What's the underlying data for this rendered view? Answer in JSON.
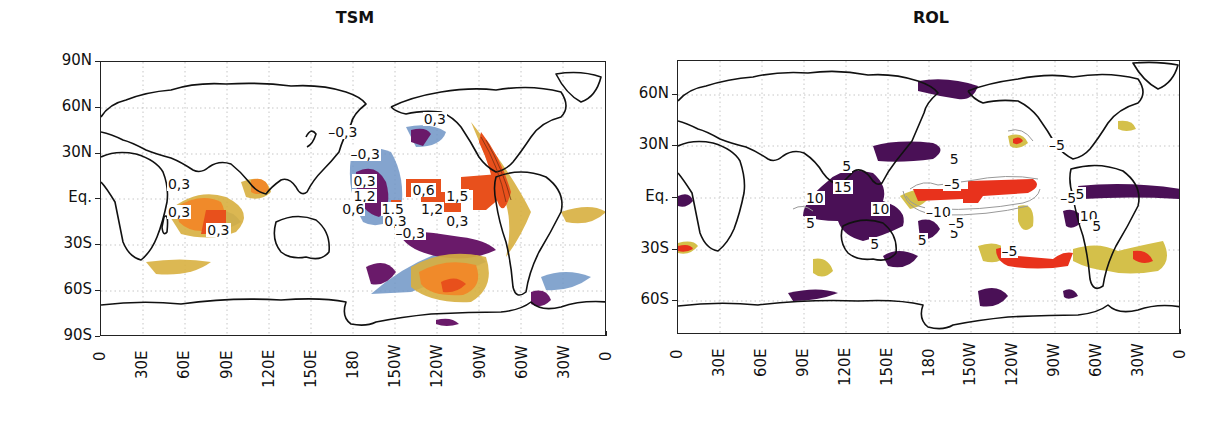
{
  "chart_data": [
    {
      "type": "heatmap",
      "title": "TSM",
      "subtitle": "",
      "xlabel": "",
      "ylabel": "",
      "x_ticks": [
        "0",
        "30E",
        "60E",
        "90E",
        "120E",
        "150E",
        "180",
        "150W",
        "120W",
        "90W",
        "60W",
        "30W",
        "0"
      ],
      "y_ticks": [
        "90N",
        "60N",
        "30N",
        "Eq.",
        "30S",
        "60S",
        "90S"
      ],
      "xlim": [
        0,
        360
      ],
      "ylim": [
        -90,
        90
      ],
      "grid": true,
      "legend": null,
      "colors": {
        "positive_strong": "#e8501c",
        "positive_mid": "#f08a2a",
        "positive_weak": "#d8b040",
        "negative_strong": "#6a1a6a",
        "negative_weak": "#6f95c6"
      },
      "contour_labels": [
        {
          "text": "0,3",
          "lon": 236,
          "lat": 53
        },
        {
          "text": "–0,3",
          "lon": 168,
          "lat": 44
        },
        {
          "text": "–0,3",
          "lon": 184,
          "lat": 30
        },
        {
          "text": "0,3",
          "lon": 186,
          "lat": 12
        },
        {
          "text": "1,2",
          "lon": 186,
          "lat": 2
        },
        {
          "text": "0,6",
          "lon": 178,
          "lat": -6
        },
        {
          "text": "1,5",
          "lon": 206,
          "lat": -6
        },
        {
          "text": "0,3",
          "lon": 208,
          "lat": -14
        },
        {
          "text": "–0,3",
          "lon": 216,
          "lat": -22
        },
        {
          "text": "0,6",
          "lon": 228,
          "lat": 6
        },
        {
          "text": "1,5",
          "lon": 252,
          "lat": 2
        },
        {
          "text": "1,2",
          "lon": 234,
          "lat": -6
        },
        {
          "text": "0,3",
          "lon": 252,
          "lat": -14
        },
        {
          "text": "0,3",
          "lon": 54,
          "lat": 10
        },
        {
          "text": "0,3",
          "lon": 54,
          "lat": -8
        },
        {
          "text": "0,3",
          "lon": 82,
          "lat": -20
        }
      ]
    },
    {
      "type": "heatmap",
      "title": "ROL",
      "subtitle": "",
      "xlabel": "",
      "ylabel": "",
      "x_ticks": [
        "0",
        "30E",
        "60E",
        "90E",
        "120E",
        "150E",
        "180",
        "150W",
        "120W",
        "90W",
        "60W",
        "30W",
        "0"
      ],
      "y_ticks": [
        "60N",
        "30N",
        "Eq.",
        "30S",
        "60S"
      ],
      "xlim": [
        0,
        360
      ],
      "ylim": [
        -78,
        78
      ],
      "grid": true,
      "legend": null,
      "colors": {
        "negative_strong": "#e8321c",
        "negative_mid": "#f07a20",
        "negative_weak": "#d4c04a",
        "positive_strong": "#4a1056",
        "positive_weak": "#5b6fb0",
        "contour": "#888888"
      },
      "contour_labels": [
        {
          "text": "5",
          "lon": 124,
          "lat": 18
        },
        {
          "text": "15",
          "lon": 118,
          "lat": 6
        },
        {
          "text": "10",
          "lon": 98,
          "lat": 0
        },
        {
          "text": "10",
          "lon": 145,
          "lat": -6
        },
        {
          "text": "5",
          "lon": 98,
          "lat": -14
        },
        {
          "text": "5",
          "lon": 144,
          "lat": -26
        },
        {
          "text": "5",
          "lon": 178,
          "lat": -24
        },
        {
          "text": "5",
          "lon": 201,
          "lat": -20
        },
        {
          "text": "5",
          "lon": 201,
          "lat": 22
        },
        {
          "text": "–5",
          "lon": 197,
          "lat": 8
        },
        {
          "text": "–10",
          "lon": 184,
          "lat": -8
        },
        {
          "text": "–5",
          "lon": 200,
          "lat": -14
        },
        {
          "text": "–5",
          "lon": 272,
          "lat": 30
        },
        {
          "text": "–5",
          "lon": 280,
          "lat": 0
        },
        {
          "text": "5",
          "lon": 291,
          "lat": 2
        },
        {
          "text": "10",
          "lon": 294,
          "lat": -10
        },
        {
          "text": "5",
          "lon": 303,
          "lat": -16
        },
        {
          "text": "–5",
          "lon": 238,
          "lat": -30
        }
      ]
    }
  ],
  "panels": {
    "tsm": {
      "title": "TSM",
      "y_ticks": [
        "90N",
        "60N",
        "30N",
        "Eq.",
        "30S",
        "60S",
        "90S"
      ],
      "x_ticks": [
        "0",
        "30E",
        "60E",
        "90E",
        "120E",
        "150E",
        "180",
        "150W",
        "120W",
        "90W",
        "60W",
        "30W",
        "0"
      ]
    },
    "rol": {
      "title": "ROL",
      "y_ticks": [
        "60N",
        "30N",
        "Eq.",
        "30S",
        "60S"
      ],
      "x_ticks": [
        "0",
        "30E",
        "60E",
        "90E",
        "120E",
        "150E",
        "180",
        "150W",
        "120W",
        "90W",
        "60W",
        "30W",
        "0"
      ]
    }
  }
}
